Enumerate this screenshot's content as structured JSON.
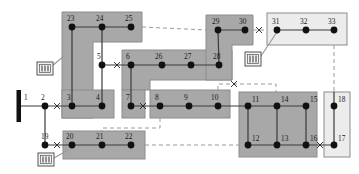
{
  "diagram": {
    "type": "single-line-network",
    "canvas": {
      "width": 359,
      "height": 174
    },
    "colors": {
      "zone_fill_dark": "#a8a8a8",
      "zone_fill_light": "#ececec",
      "zone_stroke": "#8c8c8c",
      "line": "#3a3a3a",
      "node": "#111111",
      "dashed": "#999999",
      "label": "#1a1a1a",
      "source_bar": "#111111",
      "icon_fill": "#f2f2f2",
      "icon_stroke": "#555555"
    },
    "zones": [
      {
        "name": "zone-upper-left-L",
        "fill": "dark",
        "shape": "L"
      },
      {
        "name": "zone-mid-upper-L",
        "fill": "dark",
        "shape": "L"
      },
      {
        "name": "zone-upper-right-L",
        "fill": "dark",
        "shape": "L"
      },
      {
        "name": "zone-feeder-31-33",
        "fill": "light",
        "shape": "rect"
      },
      {
        "name": "zone-bus-3-4",
        "fill": "dark",
        "shape": "rect"
      },
      {
        "name": "zone-bus-7",
        "fill": "dark",
        "shape": "rect"
      },
      {
        "name": "zone-bus-8-10",
        "fill": "dark",
        "shape": "rect"
      },
      {
        "name": "zone-grid-11-16",
        "fill": "dark",
        "shape": "rect"
      },
      {
        "name": "zone-bus-17-18",
        "fill": "light",
        "shape": "rect"
      },
      {
        "name": "zone-bus-20-22",
        "fill": "dark",
        "shape": "rect"
      }
    ],
    "source": {
      "label": "1",
      "kind": "slack-bus-bar"
    },
    "nodes": [
      {
        "id": "1",
        "label": "1",
        "x": 19,
        "y": 104,
        "kind": "source-bar",
        "label_x": 24,
        "label_y": 94
      },
      {
        "id": "2",
        "label": "2",
        "x": 45,
        "y": 106,
        "kind": "bus",
        "label_x": 41,
        "label_y": 94
      },
      {
        "id": "3",
        "label": "3",
        "x": 72,
        "y": 106,
        "kind": "bus",
        "label_x": 67,
        "label_y": 94
      },
      {
        "id": "4",
        "label": "4",
        "x": 102,
        "y": 106,
        "kind": "bus",
        "label_x": 96,
        "label_y": 94
      },
      {
        "id": "5",
        "label": "5",
        "x": 102,
        "y": 65,
        "kind": "bus",
        "label_x": 97,
        "label_y": 53
      },
      {
        "id": "6",
        "label": "6",
        "x": 131,
        "y": 65,
        "kind": "bus",
        "label_x": 126,
        "label_y": 53
      },
      {
        "id": "7",
        "label": "7",
        "x": 131,
        "y": 106,
        "kind": "bus",
        "label_x": 126,
        "label_y": 94
      },
      {
        "id": "8",
        "label": "8",
        "x": 160,
        "y": 106,
        "kind": "bus",
        "label_x": 155,
        "label_y": 94
      },
      {
        "id": "9",
        "label": "9",
        "x": 189,
        "y": 106,
        "kind": "bus",
        "label_x": 184,
        "label_y": 94
      },
      {
        "id": "10",
        "label": "10",
        "x": 218,
        "y": 106,
        "kind": "bus",
        "label_x": 211,
        "label_y": 94
      },
      {
        "id": "11",
        "label": "11",
        "x": 248,
        "y": 106,
        "kind": "bus",
        "label_x": 252,
        "label_y": 96
      },
      {
        "id": "12",
        "label": "12",
        "x": 248,
        "y": 145,
        "kind": "bus",
        "label_x": 252,
        "label_y": 135
      },
      {
        "id": "13",
        "label": "13",
        "x": 277,
        "y": 145,
        "kind": "bus",
        "label_x": 281,
        "label_y": 135
      },
      {
        "id": "14",
        "label": "14",
        "x": 277,
        "y": 106,
        "kind": "bus",
        "label_x": 281,
        "label_y": 96
      },
      {
        "id": "15",
        "label": "15",
        "x": 306,
        "y": 106,
        "kind": "bus",
        "label_x": 310,
        "label_y": 96
      },
      {
        "id": "16",
        "label": "16",
        "x": 306,
        "y": 145,
        "kind": "bus",
        "label_x": 310,
        "label_y": 135
      },
      {
        "id": "17",
        "label": "17",
        "x": 334,
        "y": 145,
        "kind": "bus",
        "label_x": 338,
        "label_y": 135
      },
      {
        "id": "18",
        "label": "18",
        "x": 334,
        "y": 106,
        "kind": "bus",
        "label_x": 338,
        "label_y": 96
      },
      {
        "id": "19",
        "label": "19",
        "x": 45,
        "y": 145,
        "kind": "bus",
        "label_x": 41,
        "label_y": 133
      },
      {
        "id": "20",
        "label": "20",
        "x": 72,
        "y": 145,
        "kind": "bus",
        "label_x": 66,
        "label_y": 133
      },
      {
        "id": "21",
        "label": "21",
        "x": 102,
        "y": 145,
        "kind": "bus",
        "label_x": 96,
        "label_y": 133
      },
      {
        "id": "22",
        "label": "22",
        "x": 131,
        "y": 145,
        "kind": "bus",
        "label_x": 125,
        "label_y": 133
      },
      {
        "id": "23",
        "label": "23",
        "x": 72,
        "y": 27,
        "kind": "bus",
        "label_x": 67,
        "label_y": 15
      },
      {
        "id": "24",
        "label": "24",
        "x": 102,
        "y": 27,
        "kind": "bus",
        "label_x": 96,
        "label_y": 15
      },
      {
        "id": "25",
        "label": "25",
        "x": 131,
        "y": 27,
        "kind": "bus",
        "label_x": 125,
        "label_y": 15
      },
      {
        "id": "26",
        "label": "26",
        "x": 162,
        "y": 65,
        "kind": "bus",
        "label_x": 155,
        "label_y": 53
      },
      {
        "id": "27",
        "label": "27",
        "x": 191,
        "y": 65,
        "kind": "bus",
        "label_x": 184,
        "label_y": 53
      },
      {
        "id": "28",
        "label": "28",
        "x": 219,
        "y": 65,
        "kind": "bus",
        "label_x": 213,
        "label_y": 53
      },
      {
        "id": "29",
        "label": "29",
        "x": 218,
        "y": 30,
        "kind": "bus",
        "label_x": 212,
        "label_y": 18
      },
      {
        "id": "30",
        "label": "30",
        "x": 245,
        "y": 30,
        "kind": "bus",
        "label_x": 239,
        "label_y": 18
      },
      {
        "id": "31",
        "label": "31",
        "x": 277,
        "y": 30,
        "kind": "bus",
        "label_x": 272,
        "label_y": 18
      },
      {
        "id": "32",
        "label": "32",
        "x": 306,
        "y": 30,
        "kind": "bus",
        "label_x": 300,
        "label_y": 18
      },
      {
        "id": "33",
        "label": "33",
        "x": 334,
        "y": 30,
        "kind": "bus",
        "label_x": 328,
        "label_y": 18
      }
    ],
    "transformers": [
      {
        "name": "transformer-left",
        "x": 37,
        "y": 62,
        "w": 16,
        "h": 13
      },
      {
        "name": "transformer-right",
        "x": 245,
        "y": 52,
        "w": 16,
        "h": 14
      },
      {
        "name": "transformer-bottom",
        "x": 38,
        "y": 153,
        "w": 16,
        "h": 13
      }
    ],
    "switches": [
      {
        "name": "switch-2-3",
        "x": 57,
        "y": 106
      },
      {
        "name": "switch-5-6",
        "x": 117,
        "y": 65
      },
      {
        "name": "switch-7-8",
        "x": 143,
        "y": 106
      },
      {
        "name": "switch-30-31",
        "x": 259,
        "y": 30
      },
      {
        "name": "switch-10-11",
        "x": 234,
        "y": 90
      },
      {
        "name": "switch-16-17",
        "x": 320,
        "y": 145
      },
      {
        "name": "switch-19-20",
        "x": 57,
        "y": 145
      }
    ],
    "legend": {
      "solid_line": "closed branch",
      "dashed_line": "open tie branch",
      "cross_mark": "switch / breaker"
    }
  }
}
